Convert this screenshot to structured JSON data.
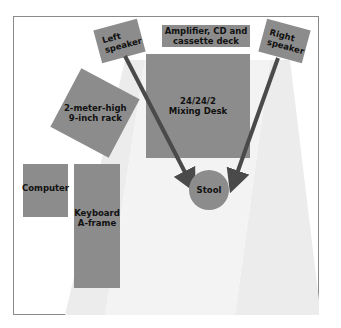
{
  "diagram": {
    "type": "studio-floor-plan",
    "colors": {
      "equipment_fill": "#8c8c8c",
      "arrow": "#4a4a4a",
      "beam": "#ececec",
      "frame_border": "#8a8a8a"
    },
    "items": {
      "left_speaker": "Left\nspeaker",
      "right_speaker": "Right\nspeaker",
      "amplifier": "Amplifier, CD and\ncassette deck",
      "mixing_desk": "24/24/2\nMixing Desk",
      "rack": "2-meter-high\n9-inch rack",
      "computer": "Computer",
      "keyboard": "Keyboard\nA-frame",
      "stool": "Stool"
    },
    "arrows": [
      {
        "from": "left_speaker",
        "to": "stool"
      },
      {
        "from": "right_speaker",
        "to": "stool"
      }
    ]
  }
}
